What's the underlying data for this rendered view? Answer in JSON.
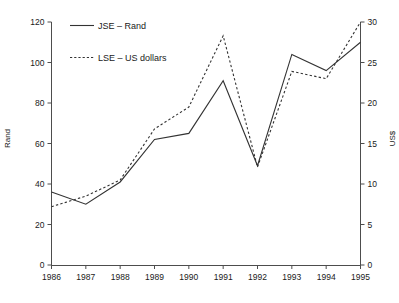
{
  "chart_data": {
    "type": "line",
    "title": "",
    "subtitle": "",
    "xlabel": "",
    "ylabel": "Rand",
    "y2label": "US$",
    "grid": false,
    "legend_position": "top-left-inside",
    "categories": [
      "1986",
      "1987",
      "1988",
      "1989",
      "1990",
      "1991",
      "1992",
      "1993",
      "1994",
      "1995"
    ],
    "x": [
      1986,
      1987,
      1988,
      1989,
      1990,
      1991,
      1992,
      1993,
      1994,
      1995
    ],
    "xlim": [
      1986,
      1995
    ],
    "ylim": [
      0,
      120
    ],
    "y2lim": [
      0,
      30
    ],
    "yticks": [
      0,
      20,
      40,
      60,
      80,
      100,
      120
    ],
    "y2ticks": [
      0,
      5,
      10,
      15,
      20,
      25,
      30
    ],
    "xticks": [
      "1986",
      "1987",
      "1988",
      "1989",
      "1990",
      "1991",
      "1992",
      "1993",
      "1994",
      "1995"
    ],
    "series": [
      {
        "name": "JSE – Rand",
        "axis": "left",
        "style": "solid",
        "color": "#333333",
        "values": [
          36,
          30,
          41,
          62,
          65,
          91,
          49,
          104,
          96,
          110
        ]
      },
      {
        "name": "LSE – US dollars",
        "axis": "right",
        "style": "dotted",
        "color": "#333333",
        "values": [
          7.2,
          8.5,
          10.5,
          16.8,
          19.5,
          28.3,
          12.1,
          23.9,
          23.0,
          30.0
        ]
      }
    ],
    "legend": [
      {
        "label": "JSE – Rand",
        "style": "solid"
      },
      {
        "label": "LSE – US dollars",
        "style": "dotted"
      }
    ]
  }
}
